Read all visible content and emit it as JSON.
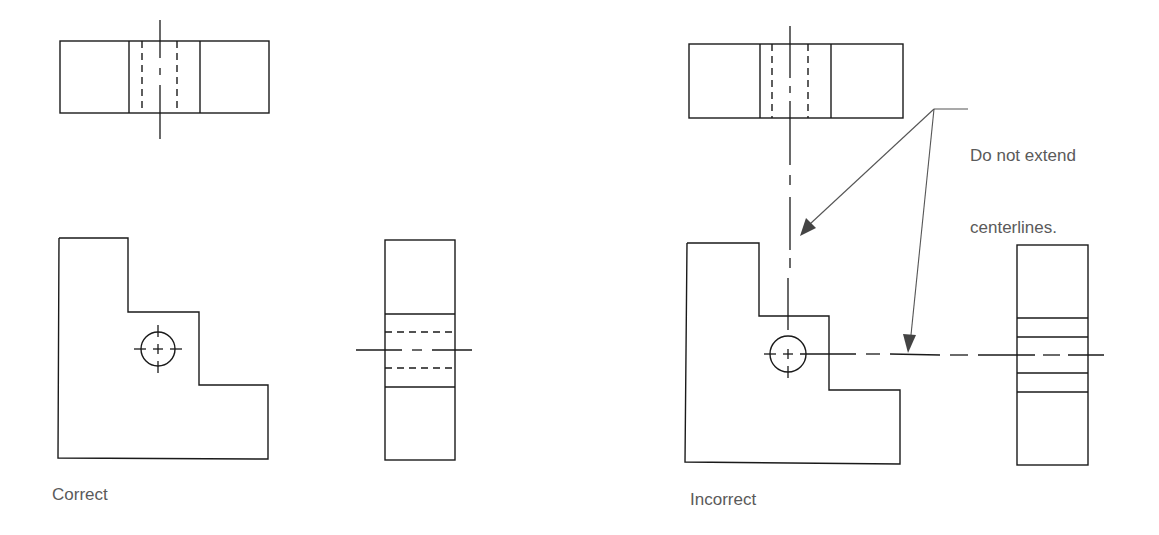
{
  "diagram": {
    "type": "technical-drawing",
    "panels": [
      {
        "id": "correct",
        "caption": "Correct"
      },
      {
        "id": "incorrect",
        "caption": "Incorrect"
      }
    ],
    "annotation": {
      "line1": "Do not extend",
      "line2": "centerlines."
    },
    "colors": {
      "line": "#1a1a1a",
      "text": "#5a5a5a",
      "leader": "#555555",
      "background": "#ffffff"
    }
  }
}
